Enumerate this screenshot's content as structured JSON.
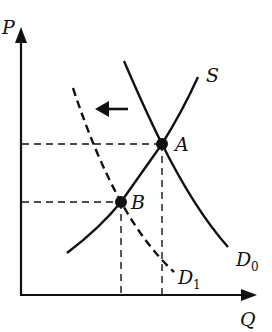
{
  "diagram": {
    "type": "supply-demand",
    "axes": {
      "y_label": "P",
      "x_label": "Q"
    },
    "curves": {
      "supply": {
        "label": "S",
        "style": "solid"
      },
      "demand_initial": {
        "label": "D",
        "subscript": "0",
        "style": "solid"
      },
      "demand_new": {
        "label": "D",
        "subscript": "1",
        "style": "dashed"
      }
    },
    "points": {
      "initial_equilibrium": {
        "label": "A"
      },
      "new_equilibrium": {
        "label": "B"
      }
    },
    "shift_arrow": {
      "direction": "left"
    },
    "colors": {
      "line": "#111111",
      "background": "#ffffff"
    }
  }
}
